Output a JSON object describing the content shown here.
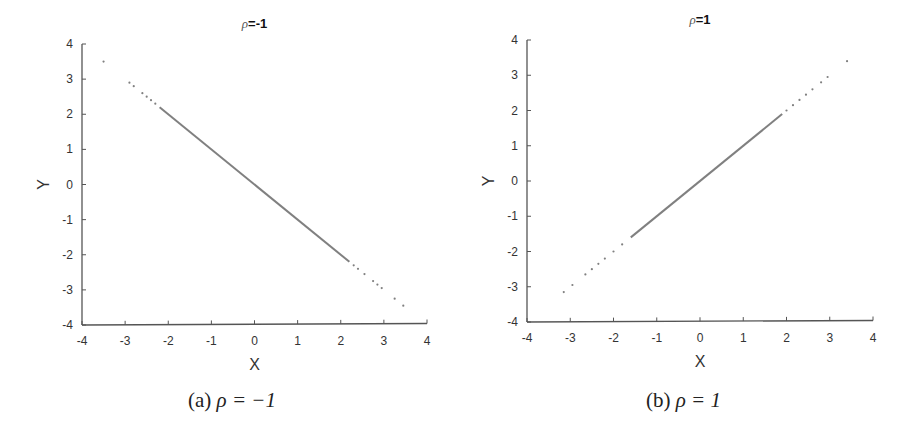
{
  "chart_data": [
    {
      "type": "scatter",
      "title": "ρ=-1",
      "title_symbol": "ρ",
      "title_value": "=-1",
      "xlabel": "X",
      "ylabel": "Y",
      "xlim": [
        -4,
        4
      ],
      "ylim": [
        -4,
        4
      ],
      "xticks": [
        "-4",
        "-3",
        "-2",
        "-1",
        "0",
        "1",
        "2",
        "3",
        "4"
      ],
      "yticks": [
        "4",
        "3",
        "2",
        "1",
        "0",
        "-1",
        "-2",
        "-3",
        "-4"
      ],
      "grid": false,
      "caption_label": "(a)",
      "caption_math": "ρ = −1",
      "color": "#808080",
      "description": "Points lie exactly on line y = -x; dense between x≈-2.2 and x≈2.2, sparse in tails",
      "dense_range": [
        -2.2,
        2.2
      ],
      "points": [
        [
          -3.5,
          3.5
        ],
        [
          -2.9,
          2.9
        ],
        [
          -2.8,
          2.8
        ],
        [
          -2.6,
          2.6
        ],
        [
          -2.5,
          2.5
        ],
        [
          -2.4,
          2.4
        ],
        [
          -2.3,
          2.3
        ],
        [
          2.3,
          -2.3
        ],
        [
          2.4,
          -2.4
        ],
        [
          2.55,
          -2.55
        ],
        [
          2.75,
          -2.75
        ],
        [
          2.85,
          -2.85
        ],
        [
          2.95,
          -2.95
        ],
        [
          3.25,
          -3.25
        ],
        [
          3.45,
          -3.45
        ]
      ]
    },
    {
      "type": "scatter",
      "title": "ρ=1",
      "title_symbol": "ρ",
      "title_value": "=1",
      "xlabel": "X",
      "ylabel": "Y",
      "xlim": [
        -4,
        4
      ],
      "ylim": [
        -4,
        4
      ],
      "xticks": [
        "-4",
        "-3",
        "-2",
        "-1",
        "0",
        "1",
        "2",
        "3",
        "4"
      ],
      "yticks": [
        "4",
        "3",
        "2",
        "1",
        "0",
        "-1",
        "-2",
        "-3",
        "-4"
      ],
      "grid": false,
      "caption_label": "(b)",
      "caption_math": "ρ = 1",
      "color": "#808080",
      "description": "Points lie exactly on line y = x; dense between x≈-1.6 and x≈1.9, sparse in tails",
      "dense_range": [
        -1.6,
        1.9
      ],
      "points": [
        [
          -3.15,
          -3.15
        ],
        [
          -2.95,
          -2.95
        ],
        [
          -2.65,
          -2.65
        ],
        [
          -2.5,
          -2.5
        ],
        [
          -2.35,
          -2.35
        ],
        [
          -2.2,
          -2.2
        ],
        [
          -2.0,
          -2.0
        ],
        [
          -1.8,
          -1.8
        ],
        [
          2.0,
          2.0
        ],
        [
          2.15,
          2.15
        ],
        [
          2.3,
          2.3
        ],
        [
          2.45,
          2.45
        ],
        [
          2.6,
          2.6
        ],
        [
          2.8,
          2.8
        ],
        [
          2.95,
          2.95
        ],
        [
          3.4,
          3.4
        ]
      ]
    }
  ]
}
